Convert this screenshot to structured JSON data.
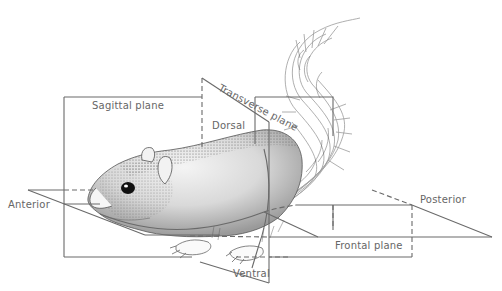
{
  "diagram": {
    "type": "anatomical-planes",
    "labels": {
      "sagittal": "Sagittal plane",
      "transverse": "Transverse plane",
      "frontal": "Frontal plane",
      "dorsal": "Dorsal",
      "ventral": "Ventral",
      "anterior": "Anterior",
      "posterior": "Posterior"
    },
    "colors": {
      "line": "#6a6a6a",
      "label": "#666666",
      "fur_dark": "#3a3a3a",
      "fur_light": "#bdbdbd",
      "background": "#ffffff"
    }
  }
}
